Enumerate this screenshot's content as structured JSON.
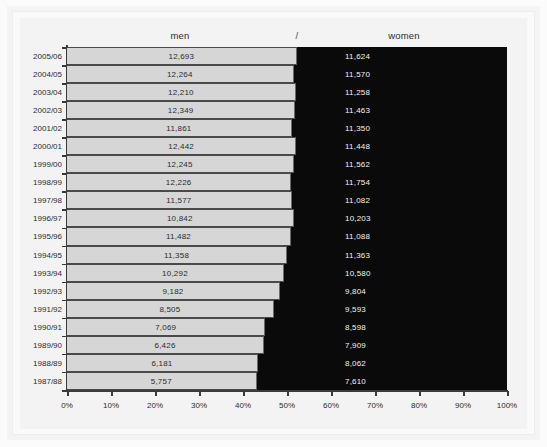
{
  "chart_data": {
    "type": "bar",
    "subtype": "100% stacked horizontal bar",
    "title": "",
    "xlabel": "",
    "ylabel": "",
    "xlim": [
      0,
      100
    ],
    "grid": false,
    "legend_position": "top (inline series headers)",
    "separator": "/",
    "categories": [
      "2005/06",
      "2004/05",
      "2003/04",
      "2002/03",
      "2001/02",
      "2000/01",
      "1999/00",
      "1998/99",
      "1997/98",
      "1996/97",
      "1995/96",
      "1994/95",
      "1993/94",
      "1992/93",
      "1991/92",
      "1990/91",
      "1989/90",
      "1988/89",
      "1987/88"
    ],
    "xticks": [
      "0%",
      "10%",
      "20%",
      "30%",
      "40%",
      "50%",
      "60%",
      "70%",
      "80%",
      "90%",
      "100%"
    ],
    "series": [
      {
        "name": "men",
        "color": "#d6d6d6",
        "values": [
          12693,
          12264,
          12210,
          12349,
          11861,
          12442,
          12245,
          12226,
          11577,
          10842,
          11482,
          11358,
          10292,
          9182,
          8505,
          7069,
          6426,
          6181,
          5757
        ],
        "labels": [
          "12,693",
          "12,264",
          "12,210",
          "12,349",
          "11,861",
          "12,442",
          "12,245",
          "12,226",
          "11,577",
          "10,842",
          "11,482",
          "11,358",
          "10,292",
          "9,182",
          "8,505",
          "7,069",
          "6,426",
          "6,181",
          "5,757"
        ],
        "percents": [
          52.2,
          51.5,
          52.0,
          51.9,
          51.1,
          52.1,
          51.5,
          51.0,
          51.1,
          51.5,
          50.9,
          50.0,
          49.3,
          48.4,
          47.0,
          45.1,
          44.8,
          43.4,
          43.1
        ]
      },
      {
        "name": "women",
        "color": "#0a0a0a",
        "values": [
          11624,
          11570,
          11258,
          11463,
          11350,
          11448,
          11562,
          11754,
          11082,
          10203,
          11088,
          11363,
          10580,
          9804,
          9593,
          8598,
          7909,
          8062,
          7610
        ],
        "labels": [
          "11,624",
          "11,570",
          "11,258",
          "11,463",
          "11,350",
          "11,448",
          "11,562",
          "11,754",
          "11,082",
          "10,203",
          "11,088",
          "11,363",
          "10,580",
          "9,804",
          "9,593",
          "8,598",
          "7,909",
          "8,062",
          "7,610"
        ],
        "percents": [
          47.8,
          48.5,
          48.0,
          48.1,
          48.9,
          47.9,
          48.5,
          49.0,
          48.9,
          48.5,
          49.1,
          50.0,
          50.7,
          51.6,
          53.0,
          54.9,
          55.2,
          56.6,
          56.9
        ]
      }
    ]
  }
}
